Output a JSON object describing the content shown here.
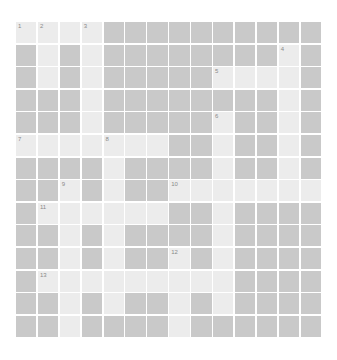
{
  "puzzle": {
    "rows": 14,
    "cols": 14,
    "colors": {
      "light": "#ececec",
      "dark": "#c9c9c9",
      "gap": "#ffffff",
      "number": "#8a8a8a"
    },
    "layout": [
      "LLLL..........",
      ".L.L........L.",
      ".L.L.....LLLL.",
      "...L........L.",
      "...L.....L..L.",
      "LLLLLLL..L..L.",
      "....L....L..L.",
      "..L.L..LLLLLLL",
      ".LLLLLL..L....",
      "..L.L....L....",
      "..L.L..L.L....",
      ".LLLLLLLLL....",
      "..L.L..L.L....",
      "..L....L......"
    ],
    "numbers": [
      {
        "n": "1",
        "r": 0,
        "c": 0
      },
      {
        "n": "2",
        "r": 0,
        "c": 1
      },
      {
        "n": "3",
        "r": 0,
        "c": 3
      },
      {
        "n": "4",
        "r": 1,
        "c": 12
      },
      {
        "n": "5",
        "r": 2,
        "c": 9
      },
      {
        "n": "6",
        "r": 4,
        "c": 9
      },
      {
        "n": "7",
        "r": 5,
        "c": 0
      },
      {
        "n": "8",
        "r": 5,
        "c": 4
      },
      {
        "n": "9",
        "r": 7,
        "c": 2
      },
      {
        "n": "10",
        "r": 7,
        "c": 7
      },
      {
        "n": "11",
        "r": 8,
        "c": 1
      },
      {
        "n": "12",
        "r": 10,
        "c": 7
      },
      {
        "n": "13",
        "r": 11,
        "c": 1
      }
    ]
  }
}
